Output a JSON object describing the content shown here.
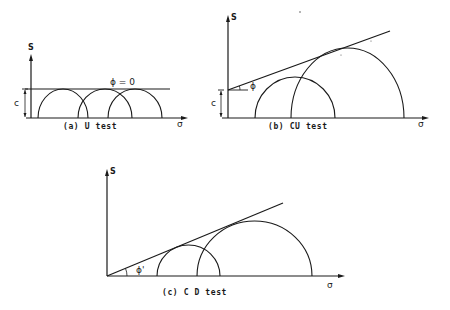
{
  "figure": {
    "panels": [
      {
        "id": "a",
        "caption": "(a) U test",
        "y_axis_label": "S",
        "x_axis_label": "σ",
        "envelope_label": "ϕ = 0",
        "cohesion_label": "c",
        "envelope_type": "horizontal",
        "circles": 3
      },
      {
        "id": "b",
        "caption": "(b)   CU test",
        "y_axis_label": "S",
        "x_axis_label": "σ",
        "angle_label": "ϕ",
        "cohesion_label": "c",
        "envelope_type": "inclined with intercept",
        "circles": 2
      },
      {
        "id": "c",
        "caption": "(c)   C D test",
        "y_axis_label": "S",
        "x_axis_label": "σ",
        "angle_label": "ϕ'",
        "envelope_type": "inclined through origin",
        "circles": 2
      }
    ]
  },
  "colors": {
    "ink": "#1a1a1a",
    "background": "#ffffff"
  }
}
